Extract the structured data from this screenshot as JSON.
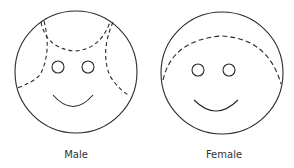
{
  "figures": [
    {
      "id": "male",
      "label": "Male",
      "hair_style": "dashed lines framing forehead and sides"
    },
    {
      "id": "female",
      "label": "Female",
      "hair_style": "dashed arc across top of head"
    }
  ],
  "colors": {
    "stroke": "#2a2a2a",
    "label": "#333333",
    "background": "#ffffff"
  }
}
